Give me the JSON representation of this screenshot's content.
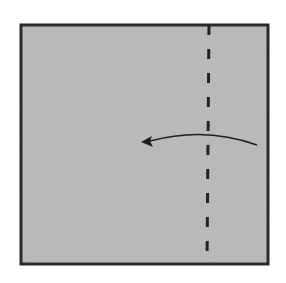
{
  "diagram": {
    "type": "origami-fold-step",
    "paper": {
      "x": 21,
      "y": 25,
      "width": 247,
      "height": 239,
      "fill": "#b9b9b9",
      "stroke": "#2a2a2a",
      "stroke_width": 3
    },
    "fold_line": {
      "style": "dashed",
      "x_top": 209,
      "x_bottom": 207,
      "y_top": 25,
      "y_bottom": 264,
      "color": "#222222",
      "stroke_width": 3,
      "dash": "10,14"
    },
    "arrow": {
      "direction": "left",
      "start": [
        257,
        145
      ],
      "control": [
        205,
        126
      ],
      "end": [
        145,
        141
      ],
      "color": "#1e1e1e",
      "stroke_width": 1.5
    },
    "labels": {
      "caption": "Fold along the dashed line toward the left"
    }
  }
}
